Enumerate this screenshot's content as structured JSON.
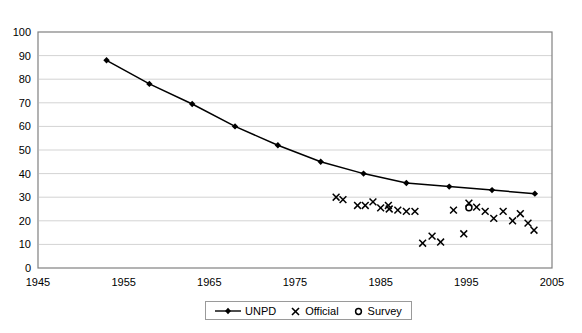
{
  "chart_data": {
    "type": "line",
    "title": "",
    "xlabel": "",
    "ylabel": "",
    "xlim": [
      1945,
      2005
    ],
    "ylim": [
      0,
      100
    ],
    "xticks": [
      1945,
      1955,
      1965,
      1975,
      1985,
      1995,
      2005
    ],
    "yticks": [
      0,
      10,
      20,
      30,
      40,
      50,
      60,
      70,
      80,
      90,
      100
    ],
    "grid": "horizontal",
    "legend_position": "bottom-center",
    "series": [
      {
        "name": "UNPD",
        "type": "line",
        "marker": "diamond",
        "color": "#000000",
        "points": [
          {
            "x": 1953,
            "y": 88
          },
          {
            "x": 1958,
            "y": 78
          },
          {
            "x": 1963,
            "y": 69.5
          },
          {
            "x": 1968,
            "y": 60
          },
          {
            "x": 1973,
            "y": 52
          },
          {
            "x": 1978,
            "y": 45
          },
          {
            "x": 1983,
            "y": 40
          },
          {
            "x": 1988,
            "y": 36
          },
          {
            "x": 1993,
            "y": 34.5
          },
          {
            "x": 1998,
            "y": 33
          },
          {
            "x": 2003,
            "y": 31.5
          }
        ]
      },
      {
        "name": "Official",
        "type": "scatter",
        "marker": "x",
        "color": "#000000",
        "points": [
          {
            "x": 1979.8,
            "y": 30
          },
          {
            "x": 1980.6,
            "y": 29
          },
          {
            "x": 1982.3,
            "y": 26.5
          },
          {
            "x": 1983.2,
            "y": 26.5
          },
          {
            "x": 1984.1,
            "y": 28
          },
          {
            "x": 1985.0,
            "y": 25.5
          },
          {
            "x": 1985.9,
            "y": 26.5
          },
          {
            "x": 1986.0,
            "y": 25
          },
          {
            "x": 1987.0,
            "y": 24.5
          },
          {
            "x": 1988.0,
            "y": 24
          },
          {
            "x": 1989.0,
            "y": 24
          },
          {
            "x": 1989.9,
            "y": 10.5
          },
          {
            "x": 1991.0,
            "y": 13.5
          },
          {
            "x": 1992.0,
            "y": 11
          },
          {
            "x": 1993.5,
            "y": 24.5
          },
          {
            "x": 1994.7,
            "y": 14.5
          },
          {
            "x": 1995.3,
            "y": 27.5
          },
          {
            "x": 1996.2,
            "y": 25.8
          },
          {
            "x": 1997.2,
            "y": 24
          },
          {
            "x": 1998.2,
            "y": 21
          },
          {
            "x": 1999.3,
            "y": 24
          },
          {
            "x": 2000.4,
            "y": 20
          },
          {
            "x": 2001.3,
            "y": 23
          },
          {
            "x": 2002.2,
            "y": 19
          },
          {
            "x": 2002.9,
            "y": 16
          }
        ]
      },
      {
        "name": "Survey",
        "type": "scatter",
        "marker": "o",
        "color": "#000000",
        "points": [
          {
            "x": 1995.3,
            "y": 25.5
          }
        ]
      }
    ]
  },
  "legend": {
    "entries": [
      {
        "label": "UNPD",
        "symbol": "line-diamond"
      },
      {
        "label": "Official",
        "symbol": "x-marker"
      },
      {
        "label": "Survey",
        "symbol": "circle-marker"
      }
    ]
  }
}
